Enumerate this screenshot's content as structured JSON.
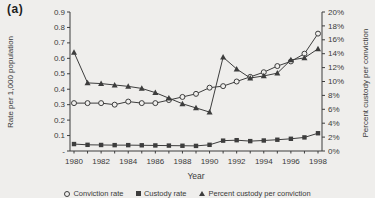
{
  "figure_label": "(a)",
  "colors": {
    "background": "#efeeec",
    "line": "#3d3d3d",
    "text": "#3a3a3a"
  },
  "chart_data": {
    "type": "line",
    "x": [
      1980,
      1981,
      1982,
      1983,
      1984,
      1985,
      1986,
      1987,
      1988,
      1989,
      1990,
      1991,
      1992,
      1993,
      1994,
      1995,
      1996,
      1997,
      1998
    ],
    "x_tick_labels": [
      "1980",
      "1982",
      "1984",
      "1986",
      "1988",
      "1990",
      "1992",
      "1994",
      "1996",
      "1998"
    ],
    "xlabel": "Year",
    "left_axis": {
      "label": "Rate per 1,000 population",
      "range": [
        0,
        0.9
      ],
      "ticks": [
        "0.9",
        "0.8",
        "0.7",
        "0.6",
        "0.5",
        "0.4",
        "0.3",
        "0.2",
        "0.1",
        "-"
      ]
    },
    "right_axis": {
      "label": "Percent custody per conviction",
      "range": [
        0,
        20
      ],
      "ticks": [
        "20%",
        "18%",
        "16%",
        "14%",
        "12%",
        "10%",
        "8%",
        "6%",
        "4%",
        "2%",
        "0%"
      ]
    },
    "grid": false,
    "legend_position": "bottom",
    "series": [
      {
        "name": "Conviction rate",
        "axis": "left",
        "marker": "circle-open",
        "values": [
          0.31,
          0.31,
          0.31,
          0.3,
          0.32,
          0.31,
          0.31,
          0.33,
          0.35,
          0.37,
          0.41,
          0.42,
          0.45,
          0.48,
          0.51,
          0.55,
          0.58,
          0.63,
          0.76
        ]
      },
      {
        "name": "Custody rate",
        "axis": "left",
        "marker": "square-filled",
        "values": [
          0.045,
          0.04,
          0.039,
          0.038,
          0.038,
          0.037,
          0.036,
          0.035,
          0.034,
          0.033,
          0.04,
          0.067,
          0.07,
          0.064,
          0.068,
          0.073,
          0.079,
          0.088,
          0.115
        ]
      },
      {
        "name": "Percent custody per conviction",
        "axis": "right",
        "marker": "triangle-filled",
        "values": [
          14.2,
          9.8,
          9.7,
          9.5,
          9.3,
          9.0,
          8.4,
          7.6,
          6.8,
          6.2,
          5.6,
          13.5,
          11.8,
          10.5,
          10.8,
          11.2,
          13.1,
          13.4,
          14.7
        ]
      }
    ]
  }
}
